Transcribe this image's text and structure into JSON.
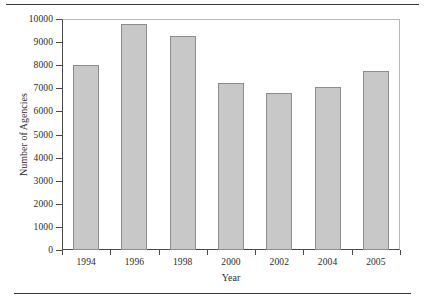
{
  "chart_data": {
    "type": "bar",
    "title": "",
    "xlabel": "Year",
    "ylabel": "Number of Agencies",
    "categories": [
      "1994",
      "1996",
      "1998",
      "2000",
      "2002",
      "2004",
      "2005"
    ],
    "values": [
      8000,
      9800,
      9250,
      7250,
      6800,
      7050,
      7750
    ],
    "ylim": [
      0,
      10000
    ],
    "ytick_labels": [
      "0",
      "1000",
      "2000",
      "3000",
      "4000",
      "5000",
      "6000",
      "7000",
      "8000",
      "9000",
      "10000"
    ],
    "ytick_values": [
      0,
      1000,
      2000,
      3000,
      4000,
      5000,
      6000,
      7000,
      8000,
      9000,
      10000
    ],
    "grid": false,
    "legend": null,
    "bar_color": "#c8c8c8",
    "bar_border_color": "#8d8d8d",
    "axis_color": "#4a4a4a"
  }
}
